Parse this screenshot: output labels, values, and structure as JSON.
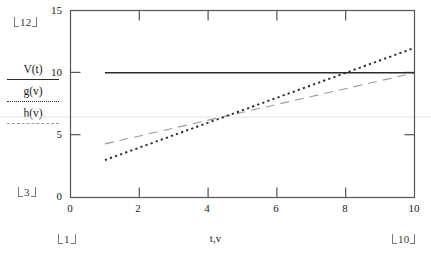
{
  "chart_data": {
    "type": "line",
    "title": "",
    "xlabel": "t,v",
    "ylabel": "",
    "xlim": [
      0,
      10
    ],
    "ylim": [
      0,
      15
    ],
    "x_ticks": [
      "0",
      "2",
      "4",
      "6",
      "8",
      "10"
    ],
    "x_tick_values": [
      0,
      2,
      4,
      6,
      8,
      10
    ],
    "y_ticks": [
      "0",
      "5",
      "10",
      "15"
    ],
    "y_tick_values": [
      0,
      5,
      10,
      15
    ],
    "grid": false,
    "legend_position": "left-outside",
    "series": [
      {
        "name": "V(t)",
        "style": "solid",
        "color": "#2b2b2b",
        "x": [
          1,
          10
        ],
        "values": [
          10,
          10
        ]
      },
      {
        "name": "g(v)",
        "style": "dotted",
        "color": "#2b2b2b",
        "x": [
          1,
          10
        ],
        "values": [
          3,
          12
        ]
      },
      {
        "name": "h(v)",
        "style": "dashed",
        "color": "#9a9a9a",
        "x": [
          1,
          10
        ],
        "values": [
          4.3,
          10
        ]
      }
    ],
    "annotations": [
      {
        "name": "y-max-range",
        "text": "12"
      },
      {
        "name": "y-min-range",
        "text": "3"
      },
      {
        "name": "x-min-range",
        "text": "1"
      },
      {
        "name": "x-max-range",
        "text": "10"
      }
    ]
  },
  "legend": {
    "entries": [
      {
        "label": "V(t)",
        "style": "solid"
      },
      {
        "label": "g(v)",
        "style": "dotted"
      },
      {
        "label": "h(v)",
        "style": "dashed"
      }
    ]
  },
  "axes": {
    "x_title": "t,v",
    "y_tick_15": "15",
    "y_tick_10": "10",
    "y_tick_5": "5",
    "y_tick_0": "0",
    "x_tick_0": "0",
    "x_tick_2": "2",
    "x_tick_4": "4",
    "x_tick_6": "6",
    "x_tick_8": "8",
    "x_tick_10": "10"
  },
  "range_markers": {
    "y_max": "12",
    "y_min": "3",
    "x_min": "1",
    "x_max": "10"
  },
  "colors": {
    "frame": "#555555",
    "series_dark": "#2b2b2b",
    "series_gray": "#9a9a9a",
    "gridline": "#e4e4e4"
  }
}
